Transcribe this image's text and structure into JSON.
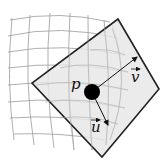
{
  "diagram": {
    "labels": {
      "point": "p",
      "vector_u": "u",
      "vector_v": "v"
    },
    "colors": {
      "grid": "#9a9a9a",
      "plane_fill": "#e6e6e6",
      "plane_edge": "#222222",
      "point": "#000000"
    }
  }
}
